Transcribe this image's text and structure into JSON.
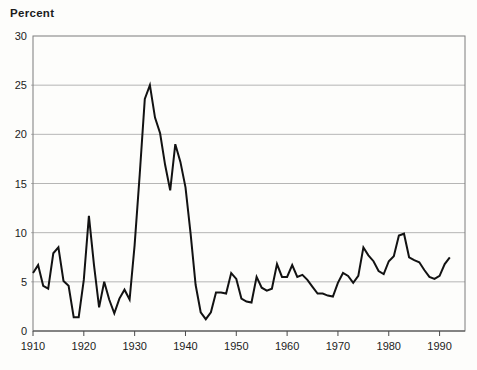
{
  "title": "Percent",
  "chart_data": {
    "type": "line",
    "title": "Percent",
    "xlabel": "",
    "ylabel": "Percent",
    "xlim": [
      1910,
      1995
    ],
    "ylim": [
      0,
      30
    ],
    "grid": "horizontal",
    "legend": "none",
    "x_tick_labels": [
      "1910",
      "1920",
      "1930",
      "1940",
      "1950",
      "1960",
      "1970",
      "1980",
      "1990"
    ],
    "x_ticks": [
      1910,
      1920,
      1930,
      1940,
      1950,
      1960,
      1970,
      1980,
      1990
    ],
    "y_tick_labels": [
      "0",
      "5",
      "10",
      "15",
      "20",
      "25",
      "30"
    ],
    "y_ticks": [
      0,
      5,
      10,
      15,
      20,
      25,
      30
    ],
    "series": [
      {
        "name": "unemployment-rate-percent",
        "x": [
          1910,
          1911,
          1912,
          1913,
          1914,
          1915,
          1916,
          1917,
          1918,
          1919,
          1920,
          1921,
          1922,
          1923,
          1924,
          1925,
          1926,
          1927,
          1928,
          1929,
          1930,
          1931,
          1932,
          1933,
          1934,
          1935,
          1936,
          1937,
          1938,
          1939,
          1940,
          1941,
          1942,
          1943,
          1944,
          1945,
          1946,
          1947,
          1948,
          1949,
          1950,
          1951,
          1952,
          1953,
          1954,
          1955,
          1956,
          1957,
          1958,
          1959,
          1960,
          1961,
          1962,
          1963,
          1964,
          1965,
          1966,
          1967,
          1968,
          1969,
          1970,
          1971,
          1972,
          1973,
          1974,
          1975,
          1976,
          1977,
          1978,
          1979,
          1980,
          1981,
          1982,
          1983,
          1984,
          1985,
          1986,
          1987,
          1988,
          1989,
          1990,
          1991,
          1992
        ],
        "values": [
          5.9,
          6.7,
          4.6,
          4.3,
          7.9,
          8.5,
          5.1,
          4.6,
          1.4,
          1.4,
          5.2,
          11.7,
          6.7,
          2.4,
          5.0,
          3.2,
          1.8,
          3.3,
          4.2,
          3.2,
          8.7,
          15.9,
          23.6,
          25.0,
          21.7,
          20.1,
          16.9,
          14.3,
          19.0,
          17.2,
          14.6,
          9.9,
          4.7,
          1.9,
          1.2,
          1.9,
          3.9,
          3.9,
          3.8,
          5.9,
          5.3,
          3.3,
          3.0,
          2.9,
          5.5,
          4.4,
          4.1,
          4.3,
          6.8,
          5.5,
          5.5,
          6.7,
          5.5,
          5.7,
          5.2,
          4.5,
          3.8,
          3.8,
          3.6,
          3.5,
          4.9,
          5.9,
          5.6,
          4.9,
          5.6,
          8.5,
          7.7,
          7.1,
          6.1,
          5.8,
          7.1,
          7.6,
          9.7,
          9.9,
          7.5,
          7.2,
          7.0,
          6.2,
          5.5,
          5.3,
          5.6,
          6.8,
          7.5
        ]
      }
    ],
    "colors": {
      "line": "#121212",
      "gridline": "#a3a3a3",
      "border": "#7c7c7c",
      "text": "#1c1c1c",
      "background": "#fdfdfb"
    },
    "layout": {
      "plot_left": 33,
      "plot_top": 36,
      "plot_right": 465,
      "plot_bottom": 331,
      "tick_length": 5
    }
  }
}
